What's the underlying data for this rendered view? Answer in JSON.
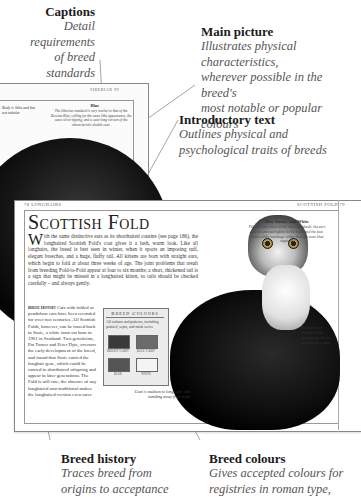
{
  "callouts": {
    "captions": {
      "title": "Captions",
      "body": [
        "Detail requirements",
        "of breed standards",
        "for showing"
      ]
    },
    "main_picture": {
      "title": "Main picture",
      "body": [
        "Illustrates physical characteristics,",
        "wherever possible in the breed's",
        "most notable or popular colours"
      ]
    },
    "introductory_text": {
      "title": "Introductory text",
      "body": [
        "Outlines physical and",
        "psychological traits of breeds"
      ]
    },
    "breed_history": {
      "title": "Breed history",
      "body": [
        "Traces breed from",
        "origins to acceptance"
      ]
    },
    "breed_colours": {
      "title": "Breed colours",
      "body": [
        "Gives accepted colours for",
        "registries in roman type,"
      ]
    }
  },
  "back_page": {
    "running_head": "SIBERIAN 99",
    "caption_left": "Body is lithe and but not tubular",
    "caption_blue_title": "Blue",
    "caption_blue_text": "The Siberian standard is very similar to that of the Russian Blue, calling for the same lithe appearance, the same silver tipping, and a semi-long version of the characteristic double coat."
  },
  "main_page": {
    "running_head_left": "78 LONGHAIRS",
    "running_head_right": "SCOTTISH FOLD 79",
    "breed_title": "Scottish Fold",
    "intro_dropcap": "W",
    "intro_text": "ith the same distinctive ears as its shorthaired cousins (see page 186), the longhaired Scottish Fold's coat gives it a lush, warm look. Like all longhairs, the breed is best seen in winter, when it sports an imposing ruff, elegant breeches, and a huge, fluffy tail. All kittens are born with straight ears, which begin to fold at about three weeks of age. The joint problems that result from breeding Fold-to-Fold appear at four to six months; a short, thickened tail is a sign that might be missed in a longhaired kitten, so tails should be checked carefully – and always gently.",
    "history_label": "Breed History",
    "history_text": "Cats with folded or pendulous ears have been recorded for over two centuries. All Scottish Folds, however, can be traced back to Susie, a white farm cat born in 1961 in Scotland. Two geneticists, Pat Turner and Peter Dyte, oversaw the early development of the breed, and found that Susie carried the longhair gene, which could be carried in shorthaired offspring and appear in later generations. The Fold is still rare; the absence of any longhaired non-traditional makes the longhaired version even rarer.",
    "colours_box": {
      "title": "Breed Colours",
      "description": "All colours and patterns, including pointed, sepia, and mink series",
      "swatches": [
        {
          "label": "BROWN TABBY",
          "color": "#3a3a3a"
        },
        {
          "label": "BLUE TABBY",
          "color": "#6b6b6b"
        },
        {
          "label": "BLUE",
          "color": "#555555"
        },
        {
          "label": "WHITE",
          "color": "#f4f4f4"
        }
      ]
    },
    "caption_blue_smoke_title": "Blue Smoke and White",
    "caption_blue_smoke": "This cat falls short of the show standards: the ears are not pressed tightly to the head, and the face shows tabby markings rather than the even blue required.",
    "caption_head": "Head is well-rounded with prominent cheeks and whisker pads",
    "caption_coat": "Coat is medium to long, soft, and standing away from body"
  }
}
